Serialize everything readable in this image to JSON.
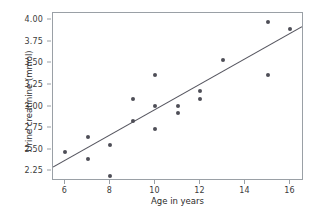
{
  "chart_data": {
    "type": "scatter",
    "title": "",
    "xlabel": "Age in years",
    "ylabel": "Urine creatinine (mmol)",
    "xlim": [
      5.45,
      16.6
    ],
    "ylim": [
      2.14,
      4.08
    ],
    "grid": false,
    "legend": null,
    "xticks": [
      6,
      8,
      10,
      12,
      14,
      16
    ],
    "xtick_labels": [
      "6",
      "8",
      "10",
      "12",
      "14",
      "16"
    ],
    "yticks": [
      2.25,
      2.5,
      2.75,
      3.0,
      3.25,
      3.5,
      3.75,
      4.0
    ],
    "ytick_labels": [
      "2.25",
      "2.50",
      "2.75",
      "3.00",
      "3.25",
      "3.50",
      "3.75",
      "4.00"
    ],
    "marker_color": "#4e4e57",
    "line_color": "#55555f",
    "axis_color": "#9aa0a6",
    "x": [
      6,
      7,
      7,
      8,
      8,
      9,
      9,
      10,
      10,
      10,
      11,
      11,
      12,
      12,
      13,
      15,
      15,
      16
    ],
    "y": [
      2.48,
      2.65,
      2.39,
      2.56,
      2.2,
      3.09,
      2.83,
      3.36,
      3.01,
      2.74,
      3.01,
      2.92,
      3.18,
      3.09,
      3.54,
      3.98,
      3.36,
      3.89
    ],
    "points": [
      {
        "x": 6,
        "y": 2.48
      },
      {
        "x": 7,
        "y": 2.65
      },
      {
        "x": 7,
        "y": 2.39
      },
      {
        "x": 8,
        "y": 2.56
      },
      {
        "x": 8,
        "y": 2.2
      },
      {
        "x": 9,
        "y": 3.09
      },
      {
        "x": 9,
        "y": 2.83
      },
      {
        "x": 10,
        "y": 3.36
      },
      {
        "x": 10,
        "y": 3.01
      },
      {
        "x": 10,
        "y": 2.74
      },
      {
        "x": 11,
        "y": 3.01
      },
      {
        "x": 11,
        "y": 2.92
      },
      {
        "x": 12,
        "y": 3.18
      },
      {
        "x": 12,
        "y": 3.09
      },
      {
        "x": 13,
        "y": 3.54
      },
      {
        "x": 15,
        "y": 3.98
      },
      {
        "x": 15,
        "y": 3.36
      },
      {
        "x": 16,
        "y": 3.89
      }
    ],
    "trendline": {
      "type": "linear-fit",
      "x_start": 5.45,
      "y_start": 2.28,
      "x_end": 16.6,
      "y_end": 3.92
    }
  }
}
